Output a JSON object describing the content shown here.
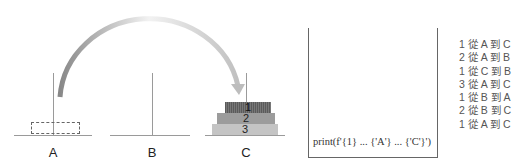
{
  "pegs": [
    {
      "label": "A"
    },
    {
      "label": "B"
    },
    {
      "label": "C"
    }
  ],
  "disks": [
    {
      "label": "1"
    },
    {
      "label": "2"
    },
    {
      "label": "3"
    }
  ],
  "code_box": {
    "code": "print(f'{1} ... {'A'} ... {'C'}')"
  },
  "output_lines": [
    "1 從 A 到 C",
    "2 從 A 到 B",
    "1 從 C 到 B",
    "3 從 A 到 C",
    "1 從 B 到 A",
    "2 從 B 到 C",
    "1 從 A 到 C"
  ],
  "colors": {
    "arrow_start": "#8c8c8c",
    "arrow_end": "#c8c8c8",
    "disk1": "#666666",
    "disk2": "#9c9c9c",
    "disk3": "#c4c4c4"
  }
}
